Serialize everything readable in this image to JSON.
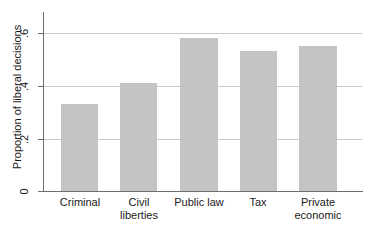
{
  "chart_data": {
    "type": "bar",
    "title": "",
    "xlabel": "",
    "ylabel": "Proportion of liberal decisions",
    "categories": [
      "Criminal",
      "Civil liberties",
      "Public law",
      "Tax",
      "Private economic"
    ],
    "category_lines": [
      [
        "Criminal"
      ],
      [
        "Civil",
        "liberties"
      ],
      [
        "Public law"
      ],
      [
        "Tax"
      ],
      [
        "Private",
        "economic"
      ]
    ],
    "values": [
      0.33,
      0.41,
      0.58,
      0.53,
      0.55
    ],
    "ylim": [
      0,
      0.66
    ],
    "yticks": [
      0,
      0.2,
      0.4,
      0.6
    ],
    "ytick_labels": [
      "0",
      ".2",
      ".4",
      ".6"
    ],
    "grid": "horizontal",
    "gridline_values": [
      0.2,
      0.4,
      0.6
    ],
    "legend": "none",
    "bar_color": "#c4c4c4",
    "axis_color": "#6e6e6e",
    "gridline_color": "#c9c9c9",
    "background_color": "#ffffff"
  }
}
